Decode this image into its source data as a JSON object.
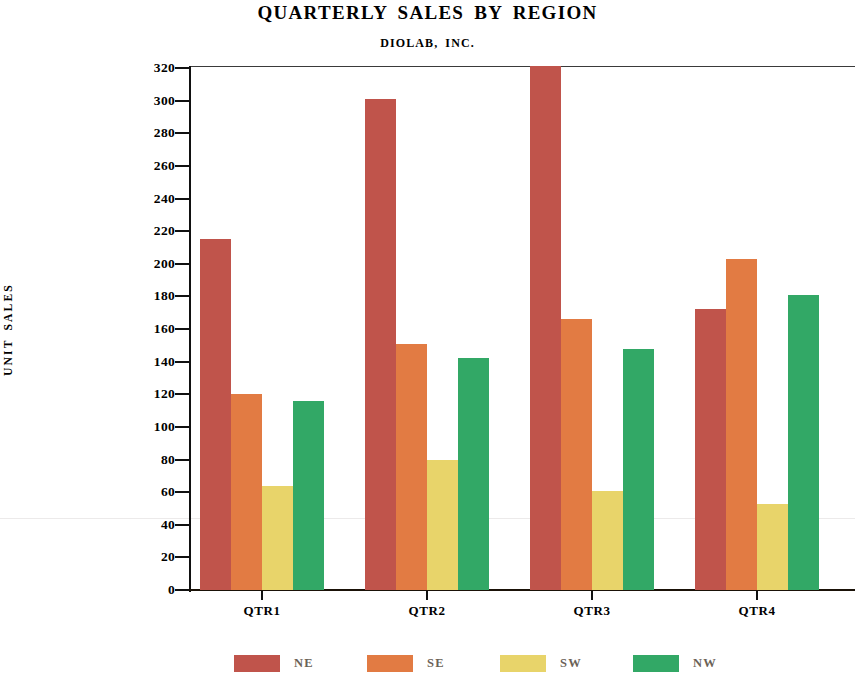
{
  "chart_data": {
    "type": "bar",
    "title": "QUARTERLY SALES BY REGION",
    "subtitle": "DIOLAB, INC.",
    "xlabel": "",
    "ylabel": "UNIT SALES",
    "categories": [
      "QTR1",
      "QTR2",
      "QTR3",
      "QTR4"
    ],
    "series": [
      {
        "name": "NE",
        "color": "#C0544B",
        "values": [
          215,
          301,
          325,
          172
        ]
      },
      {
        "name": "SE",
        "color": "#E27B43",
        "values": [
          120,
          151,
          166,
          203
        ]
      },
      {
        "name": "SW",
        "color": "#E8D46A",
        "values": [
          64,
          80,
          61,
          53
        ]
      },
      {
        "name": "NW",
        "color": "#32A866",
        "values": [
          116,
          142,
          148,
          181
        ]
      }
    ],
    "ylim": [
      0,
      320
    ],
    "ytick_step": 20,
    "ytick_labels": [
      "320",
      "300",
      "280",
      "260",
      "240",
      "220",
      "200",
      "180",
      "160",
      "140",
      "120",
      "100",
      "80",
      "60",
      "40",
      "20",
      "0"
    ],
    "grid": false,
    "legend_position": "bottom"
  },
  "legend": {
    "items": [
      {
        "label": "NE",
        "color": "#C0544B"
      },
      {
        "label": "SE",
        "color": "#E27B43"
      },
      {
        "label": "SW",
        "color": "#E8D46A"
      },
      {
        "label": "NW",
        "color": "#32A866"
      }
    ]
  }
}
